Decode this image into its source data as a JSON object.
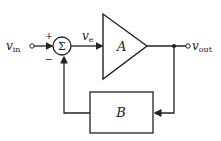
{
  "diagram": {
    "input_label": "v",
    "input_sub": "in",
    "output_label": "v",
    "output_sub": "out",
    "error_label": "v",
    "error_sub": "e",
    "summer_symbol": "Σ",
    "plus_sign": "+",
    "minus_sign": "−",
    "amplifier_label": "A",
    "feedback_label": "B"
  },
  "colors": {
    "stroke": "#222222",
    "background": "#ffffff"
  }
}
